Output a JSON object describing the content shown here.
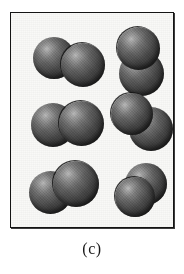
{
  "figure": {
    "caption": "(c)",
    "panel_background": "#f9f9f7",
    "border_color": "#141414",
    "atom_color_light": "#b9b9b9",
    "atom_color_dark": "#242424",
    "molecule_count": 6,
    "atoms_per_molecule": 2,
    "molecules": [
      {
        "id": "molecule-top-left",
        "row": 1,
        "column": 1,
        "orientation": "horizontal",
        "atoms": [
          {
            "id": "atom-a",
            "left": 8,
            "top": 18,
            "size": 42
          },
          {
            "id": "atom-b",
            "left": 36,
            "top": 24,
            "size": 44
          }
        ]
      },
      {
        "id": "molecule-top-right",
        "row": 1,
        "column": 2,
        "orientation": "vertical",
        "atoms": [
          {
            "id": "atom-a",
            "left": 16,
            "top": 34,
            "size": 45
          },
          {
            "id": "atom-b",
            "left": 14,
            "top": 10,
            "size": 43
          }
        ]
      },
      {
        "id": "molecule-middle-left",
        "row": 2,
        "column": 1,
        "orientation": "horizontal",
        "atoms": [
          {
            "id": "atom-a",
            "left": 4,
            "top": 14,
            "size": 44
          },
          {
            "id": "atom-b",
            "left": 32,
            "top": 12,
            "size": 45
          }
        ]
      },
      {
        "id": "molecule-middle-right",
        "row": 2,
        "column": 2,
        "orientation": "diagonal",
        "atoms": [
          {
            "id": "atom-a",
            "left": 24,
            "top": 18,
            "size": 44
          },
          {
            "id": "atom-b",
            "left": 6,
            "top": 4,
            "size": 42
          }
        ]
      },
      {
        "id": "molecule-bottom-left",
        "row": 3,
        "column": 1,
        "orientation": "horizontal",
        "atoms": [
          {
            "id": "atom-a",
            "left": 4,
            "top": 16,
            "size": 43
          },
          {
            "id": "atom-b",
            "left": 28,
            "top": 6,
            "size": 46
          }
        ]
      },
      {
        "id": "molecule-bottom-right",
        "row": 3,
        "column": 2,
        "orientation": "compact-diagonal",
        "atoms": [
          {
            "id": "atom-a",
            "left": 14,
            "top": 4,
            "size": 42
          },
          {
            "id": "atom-b",
            "left": 4,
            "top": 18,
            "size": 40
          }
        ]
      }
    ]
  }
}
